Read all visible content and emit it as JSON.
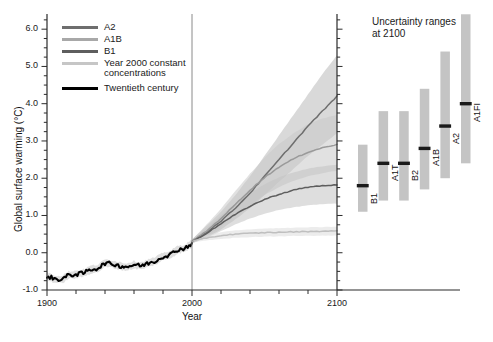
{
  "chart_data": {
    "type": "line",
    "title": "",
    "xlabel": "Year",
    "ylabel": "Global surface warming (°C)",
    "xlim": [
      1900,
      2100
    ],
    "ylim": [
      -1.0,
      6.3
    ],
    "y_major_ticks": [
      -1.0,
      0.0,
      1.0,
      2.0,
      3.0,
      4.0,
      5.0,
      6.0
    ],
    "y_major_tick_labels": [
      "-1.0",
      "0.0",
      "1.0",
      "2.0",
      "3.0",
      "4.0",
      "5.0",
      "6.0"
    ],
    "y_minor_tick_step": 0.25,
    "x_major_ticks": [
      1900,
      2000,
      2100
    ],
    "x_major_tick_labels": [
      "1900",
      "2000",
      "2100"
    ],
    "x_minor_tick_step": 20,
    "grid": false,
    "divider_year": 2000,
    "legend_position": "top-left",
    "series": [
      {
        "name": "A2",
        "color": "#6e6e6e",
        "band_color": "#b9b9b9",
        "x": [
          2000,
          2010,
          2020,
          2030,
          2040,
          2050,
          2060,
          2070,
          2080,
          2090,
          2100
        ],
        "values": [
          0.3,
          0.55,
          0.85,
          1.2,
          1.6,
          2.05,
          2.5,
          2.95,
          3.4,
          3.8,
          4.2
        ],
        "band_low": [
          0.25,
          0.4,
          0.62,
          0.9,
          1.2,
          1.55,
          1.9,
          2.25,
          2.6,
          2.9,
          3.2
        ],
        "band_high": [
          0.35,
          0.72,
          1.1,
          1.55,
          2.05,
          2.6,
          3.15,
          3.7,
          4.25,
          4.8,
          5.3
        ]
      },
      {
        "name": "A1B",
        "color": "#9a9a9a",
        "band_color": "#c9c9c9",
        "x": [
          2000,
          2010,
          2020,
          2030,
          2040,
          2050,
          2060,
          2070,
          2080,
          2090,
          2100
        ],
        "values": [
          0.3,
          0.58,
          0.92,
          1.3,
          1.68,
          2.02,
          2.3,
          2.52,
          2.7,
          2.82,
          2.9
        ],
        "band_low": [
          0.25,
          0.44,
          0.7,
          1.0,
          1.28,
          1.55,
          1.76,
          1.93,
          2.05,
          2.14,
          2.2
        ],
        "band_high": [
          0.35,
          0.75,
          1.18,
          1.66,
          2.12,
          2.55,
          2.92,
          3.2,
          3.45,
          3.6,
          3.7
        ]
      },
      {
        "name": "B1",
        "color": "#5e5e5e",
        "band_color": "#c2c2c2",
        "x": [
          2000,
          2010,
          2020,
          2030,
          2040,
          2050,
          2060,
          2070,
          2080,
          2090,
          2100
        ],
        "values": [
          0.3,
          0.52,
          0.78,
          1.03,
          1.25,
          1.43,
          1.57,
          1.68,
          1.76,
          1.8,
          1.82
        ],
        "band_low": [
          0.25,
          0.4,
          0.58,
          0.76,
          0.92,
          1.05,
          1.15,
          1.22,
          1.27,
          1.3,
          1.32
        ],
        "band_high": [
          0.35,
          0.66,
          1.0,
          1.32,
          1.6,
          1.84,
          2.02,
          2.16,
          2.26,
          2.32,
          2.36
        ]
      },
      {
        "name": "Year 2000 constant concentrations",
        "color": "#bfbfbf",
        "band_color": "#dcdcdc",
        "x": [
          2000,
          2010,
          2020,
          2030,
          2040,
          2050,
          2060,
          2070,
          2080,
          2090,
          2100
        ],
        "values": [
          0.3,
          0.4,
          0.46,
          0.5,
          0.52,
          0.54,
          0.55,
          0.56,
          0.57,
          0.58,
          0.58
        ],
        "band_low": [
          0.27,
          0.33,
          0.37,
          0.4,
          0.42,
          0.43,
          0.44,
          0.45,
          0.45,
          0.46,
          0.46
        ],
        "band_high": [
          0.33,
          0.47,
          0.55,
          0.6,
          0.63,
          0.65,
          0.66,
          0.67,
          0.68,
          0.69,
          0.7
        ]
      },
      {
        "name": "Twentieth century",
        "color": "#000000",
        "band_color": "#d4d4d4",
        "x": [
          1900,
          1905,
          1910,
          1915,
          1920,
          1925,
          1930,
          1935,
          1940,
          1945,
          1950,
          1955,
          1960,
          1965,
          1970,
          1975,
          1980,
          1985,
          1990,
          1995,
          2000
        ],
        "values": [
          -0.62,
          -0.7,
          -0.72,
          -0.6,
          -0.58,
          -0.55,
          -0.45,
          -0.42,
          -0.28,
          -0.3,
          -0.35,
          -0.38,
          -0.32,
          -0.35,
          -0.28,
          -0.22,
          -0.1,
          -0.05,
          0.08,
          0.12,
          0.25
        ],
        "band_low": [
          -0.72,
          -0.8,
          -0.82,
          -0.7,
          -0.68,
          -0.65,
          -0.55,
          -0.52,
          -0.38,
          -0.4,
          -0.45,
          -0.48,
          -0.42,
          -0.45,
          -0.38,
          -0.32,
          -0.2,
          -0.15,
          -0.02,
          0.02,
          0.15
        ],
        "band_high": [
          -0.52,
          -0.6,
          -0.62,
          -0.5,
          -0.48,
          -0.45,
          -0.35,
          -0.32,
          -0.18,
          -0.2,
          -0.25,
          -0.28,
          -0.22,
          -0.25,
          -0.18,
          -0.12,
          0.0,
          0.05,
          0.18,
          0.22,
          0.35
        ]
      }
    ],
    "uncertainty_panel": {
      "title": "Uncertainty ranges\nat 2100",
      "bars": [
        {
          "label": "B1",
          "low": 1.1,
          "high": 2.9,
          "best": 1.8
        },
        {
          "label": "A1T",
          "low": 1.4,
          "high": 3.8,
          "best": 2.4
        },
        {
          "label": "B2",
          "low": 1.4,
          "high": 3.8,
          "best": 2.4
        },
        {
          "label": "A1B",
          "low": 1.7,
          "high": 4.4,
          "best": 2.8
        },
        {
          "label": "A2",
          "low": 2.0,
          "high": 5.4,
          "best": 3.4
        },
        {
          "label": "A1FI",
          "low": 2.4,
          "high": 6.4,
          "best": 4.0
        }
      ],
      "bar_color": "#c4c4c4",
      "marker_color": "#1a1a1a"
    }
  },
  "legend": {
    "entries": [
      {
        "label": "A2",
        "color": "#6e6e6e",
        "width": 2.6
      },
      {
        "label": "A1B",
        "color": "#a8a8a8",
        "width": 2.6
      },
      {
        "label": "B1",
        "color": "#5e5e5e",
        "width": 2.8
      },
      {
        "label": "Year 2000 constant\nconcentrations",
        "color": "#c6c6c6",
        "width": 2.6
      },
      {
        "label": "Twentieth century",
        "color": "#000000",
        "width": 3.4
      }
    ]
  }
}
